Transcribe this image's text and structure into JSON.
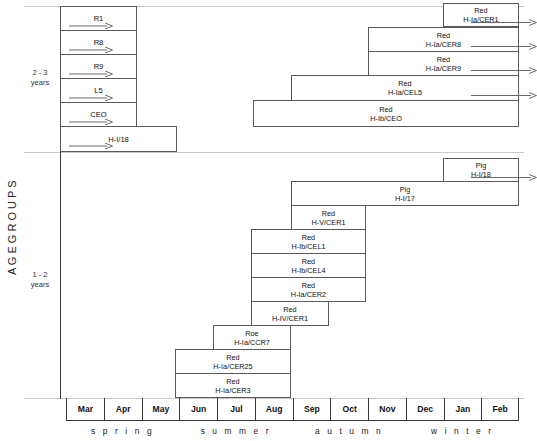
{
  "axis_caption": "A G E   G R O U P S",
  "colors": {
    "bar_border": "#5a5a5a",
    "axis_line": "#3a3a3a",
    "grid_line": "#c9c9c9",
    "text": "#111111"
  },
  "groups": [
    {
      "id": "g23",
      "label_line1": "2 - 3",
      "label_line2": "years"
    },
    {
      "id": "g12",
      "label_line1": "1 - 2",
      "label_line2": "years"
    }
  ],
  "months": [
    "Mar",
    "Apr",
    "May",
    "Jun",
    "Jul",
    "Aug",
    "Sep",
    "Oct",
    "Nov",
    "Dec",
    "Jan",
    "Feb"
  ],
  "seasons": [
    {
      "name": "s p r i n g",
      "start_month": 0,
      "span": 3
    },
    {
      "name": "s u m m e r",
      "start_month": 3,
      "span": 3
    },
    {
      "name": "a u t u m n",
      "start_month": 6,
      "span": 3
    },
    {
      "name": "w i n t e r",
      "start_month": 9,
      "span": 3
    }
  ],
  "chart_data": {
    "type": "bar",
    "title": "",
    "xlabel": "",
    "ylabel": "AGE GROUPS",
    "x_axis_type": "month",
    "x_categories": [
      "Mar",
      "Apr",
      "May",
      "Jun",
      "Jul",
      "Aug",
      "Sep",
      "Oct",
      "Nov",
      "Dec",
      "Jan",
      "Feb"
    ],
    "note": "Horizontal Gantt-style tracking ranges; left-pointing in-bar arrows and right-pointing out-arrows denote continuation beyond the plotted window.",
    "bars": [
      {
        "id": "r1",
        "group": "g23",
        "label_line1": "R1",
        "label_line2": "",
        "x": 60,
        "y": 6,
        "w": 77,
        "h": 25,
        "in_arrow": true,
        "out_arrow": false
      },
      {
        "id": "r8",
        "group": "g23",
        "label_line1": "R8",
        "label_line2": "",
        "x": 60,
        "y": 30,
        "w": 77,
        "h": 25,
        "in_arrow": true,
        "out_arrow": false
      },
      {
        "id": "r9",
        "group": "g23",
        "label_line1": "R9",
        "label_line2": "",
        "x": 60,
        "y": 54,
        "w": 77,
        "h": 25,
        "in_arrow": true,
        "out_arrow": false
      },
      {
        "id": "l5",
        "group": "g23",
        "label_line1": "L5",
        "label_line2": "",
        "x": 60,
        "y": 78,
        "w": 77,
        "h": 25,
        "in_arrow": true,
        "out_arrow": false
      },
      {
        "id": "ceo",
        "group": "g23",
        "label_line1": "CEO",
        "label_line2": "",
        "x": 60,
        "y": 102,
        "w": 77,
        "h": 25,
        "in_arrow": true,
        "out_arrow": false
      },
      {
        "id": "h118t",
        "group": "g23",
        "label_line1": "H-I/18",
        "label_line2": "",
        "x": 60,
        "y": 126,
        "w": 117,
        "h": 26,
        "in_arrow": true,
        "out_arrow": false
      },
      {
        "id": "cer1t",
        "group": "g23",
        "label_line1": "Red",
        "label_line2": "H-Ia/CER1",
        "x": 443,
        "y": 3,
        "w": 76,
        "h": 24,
        "in_arrow": false,
        "out_arrow": true
      },
      {
        "id": "cer8",
        "group": "g23",
        "label_line1": "Red",
        "label_line2": "H-Ia/CER8",
        "x": 368,
        "y": 27,
        "w": 151,
        "h": 25,
        "in_arrow": false,
        "out_arrow": true
      },
      {
        "id": "cer9",
        "group": "g23",
        "label_line1": "Red",
        "label_line2": "H-Ia/CER9",
        "x": 368,
        "y": 51,
        "w": 151,
        "h": 25,
        "in_arrow": false,
        "out_arrow": true
      },
      {
        "id": "cel5",
        "group": "g23",
        "label_line1": "Red",
        "label_line2": "H-Ia/CEL5",
        "x": 291,
        "y": 75,
        "w": 228,
        "h": 26,
        "in_arrow": false,
        "out_arrow": true
      },
      {
        "id": "ceobar",
        "group": "g23",
        "label_line1": "Red",
        "label_line2": "H-Ib/CEO",
        "x": 253,
        "y": 100,
        "w": 266,
        "h": 27,
        "in_arrow": false,
        "out_arrow": false
      },
      {
        "id": "h118b",
        "group": "g12",
        "label_line1": "Pig",
        "label_line2": "H-I/18",
        "x": 443,
        "y": 158,
        "w": 76,
        "h": 24,
        "in_arrow": false,
        "out_arrow": true
      },
      {
        "id": "h117",
        "group": "g12",
        "label_line1": "Pig",
        "label_line2": "H-I/17",
        "x": 291,
        "y": 181,
        "w": 228,
        "h": 25,
        "in_arrow": false,
        "out_arrow": false
      },
      {
        "id": "vcer1",
        "group": "g12",
        "label_line1": "Red",
        "label_line2": "H-V/CER1",
        "x": 291,
        "y": 205,
        "w": 75,
        "h": 25,
        "in_arrow": false,
        "out_arrow": false
      },
      {
        "id": "cel1",
        "group": "g12",
        "label_line1": "Red",
        "label_line2": "H-Ib/CEL1",
        "x": 251,
        "y": 229,
        "w": 115,
        "h": 25,
        "in_arrow": false,
        "out_arrow": false
      },
      {
        "id": "cel4",
        "group": "g12",
        "label_line1": "Red",
        "label_line2": "H-Ib/CEL4",
        "x": 251,
        "y": 253,
        "w": 115,
        "h": 25,
        "in_arrow": false,
        "out_arrow": false
      },
      {
        "id": "cer2",
        "group": "g12",
        "label_line1": "Red",
        "label_line2": "H-Ia/CER2",
        "x": 251,
        "y": 277,
        "w": 115,
        "h": 25,
        "in_arrow": false,
        "out_arrow": false
      },
      {
        "id": "ivcer1",
        "group": "g12",
        "label_line1": "Red",
        "label_line2": "H-IV/CER1",
        "x": 251,
        "y": 301,
        "w": 78,
        "h": 25,
        "in_arrow": false,
        "out_arrow": false
      },
      {
        "id": "ccr7",
        "group": "g12",
        "label_line1": "Roe",
        "label_line2": "H-Ia/CCR7",
        "x": 213,
        "y": 325,
        "w": 78,
        "h": 25,
        "in_arrow": false,
        "out_arrow": false
      },
      {
        "id": "cer25",
        "group": "g12",
        "label_line1": "Red",
        "label_line2": "H-Ia/CER25",
        "x": 175,
        "y": 349,
        "w": 116,
        "h": 25,
        "in_arrow": false,
        "out_arrow": false
      },
      {
        "id": "cer3",
        "group": "g12",
        "label_line1": "Red",
        "label_line2": "H-Ia/CER3",
        "x": 175,
        "y": 373,
        "w": 116,
        "h": 25,
        "in_arrow": false,
        "out_arrow": false
      }
    ]
  }
}
